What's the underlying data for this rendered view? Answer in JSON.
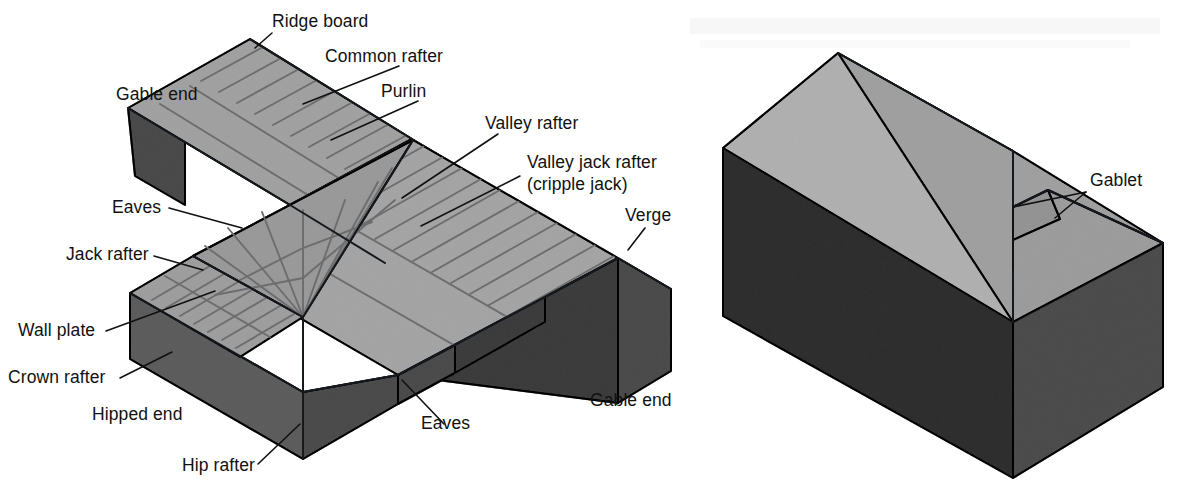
{
  "figure": {
    "background_color": "#ffffff",
    "colors": {
      "roof_light": "#cfcfcf",
      "roof_lighter": "#d8d8d8",
      "roof_mid": "#c4c4c4",
      "wall_dark": "#8d8d8d",
      "wall_darker": "#787878",
      "wall_shadow": "#6f6f6f",
      "rafter_line": "#6d6d6d",
      "outline": "#15181c",
      "label_text": "#111111",
      "leader_line": "#111111"
    }
  },
  "left_diagram": {
    "name": "hipped-and-gable-roof-with-valley",
    "labels": [
      {
        "id": "ridge-board",
        "text": "Ridge board",
        "x": 272,
        "y": 27,
        "anchor": "start"
      },
      {
        "id": "common-rafter",
        "text": "Common rafter",
        "x": 325,
        "y": 62,
        "anchor": "start"
      },
      {
        "id": "purlin",
        "text": "Purlin",
        "x": 381,
        "y": 97,
        "anchor": "start"
      },
      {
        "id": "gable-end-top",
        "text": "Gable end",
        "x": 116,
        "y": 100,
        "anchor": "start"
      },
      {
        "id": "valley-rafter",
        "text": "Valley rafter",
        "x": 485,
        "y": 129,
        "anchor": "start"
      },
      {
        "id": "valley-jack-rafter",
        "text": "Valley jack rafter",
        "x": 527,
        "y": 168,
        "anchor": "start"
      },
      {
        "id": "cripple-jack",
        "text": "(cripple jack)",
        "x": 527,
        "y": 190,
        "anchor": "start"
      },
      {
        "id": "eaves-left",
        "text": "Eaves",
        "x": 112,
        "y": 213,
        "anchor": "start"
      },
      {
        "id": "verge",
        "text": "Verge",
        "x": 625,
        "y": 221,
        "anchor": "start"
      },
      {
        "id": "jack-rafter",
        "text": "Jack rafter",
        "x": 66,
        "y": 260,
        "anchor": "start"
      },
      {
        "id": "wall-plate",
        "text": "Wall plate",
        "x": 18,
        "y": 336,
        "anchor": "start"
      },
      {
        "id": "crown-rafter",
        "text": "Crown rafter",
        "x": 8,
        "y": 383,
        "anchor": "start"
      },
      {
        "id": "hipped-end",
        "text": "Hipped end",
        "x": 92,
        "y": 420,
        "anchor": "start"
      },
      {
        "id": "eaves-bottom",
        "text": "Eaves",
        "x": 421,
        "y": 429,
        "anchor": "start"
      },
      {
        "id": "gable-end-bottom",
        "text": "Gable end",
        "x": 590,
        "y": 406,
        "anchor": "start"
      },
      {
        "id": "hip-rafter",
        "text": "Hip rafter",
        "x": 182,
        "y": 471,
        "anchor": "start"
      }
    ]
  },
  "right_diagram": {
    "name": "gablet-roof",
    "labels": [
      {
        "id": "gablet",
        "text": "Gablet",
        "x": 1090,
        "y": 186,
        "anchor": "start"
      }
    ]
  },
  "page_bleed_through": {
    "note": "faint reversed show-through text from the opposite page, illegible",
    "text": " "
  }
}
